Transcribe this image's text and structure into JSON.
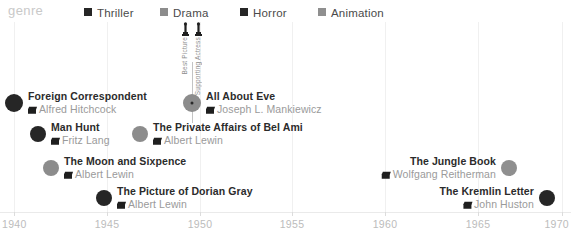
{
  "legend": {
    "title": "genre",
    "items": [
      {
        "label": "Thriller",
        "color": "#262626",
        "x": 84
      },
      {
        "label": "Drama",
        "color": "#8c8c8c",
        "x": 160
      },
      {
        "label": "Horror",
        "color": "#262626",
        "x": 240
      },
      {
        "label": "Animation",
        "color": "#8f8f8f",
        "x": 318
      }
    ]
  },
  "axis": {
    "label": "",
    "ticks": [
      {
        "value": 1940,
        "label": "1940",
        "x": 14
      },
      {
        "value": 1945,
        "label": "1945",
        "x": 107
      },
      {
        "value": 1950,
        "label": "1950",
        "x": 200
      },
      {
        "value": 1955,
        "label": "1955",
        "x": 292
      },
      {
        "value": 1960,
        "label": "1960",
        "x": 385
      },
      {
        "value": 1965,
        "label": "1965",
        "x": 478
      },
      {
        "value": 1970,
        "label": "1970",
        "x": 562
      }
    ]
  },
  "annotation": {
    "stem_x": 192,
    "stem_top": 40,
    "stem_bottom": 101,
    "awards": [
      {
        "icon": "award-statuette-icon",
        "text": "Best Picture"
      },
      {
        "icon": "award-statuette-icon",
        "text": "Supporting Actress"
      }
    ]
  },
  "chart_data": {
    "type": "scatter",
    "title": "",
    "subtitle": "",
    "xlabel": "",
    "ylabel": "",
    "xlim": [
      1940,
      1970
    ],
    "grid": true,
    "legend_position": "top",
    "categories": [
      "Thriller",
      "Drama",
      "Horror",
      "Animation"
    ],
    "points": [
      {
        "title": "Foreign Correspondent",
        "director": "Alfred Hitchcock",
        "year": 1940,
        "genre": "Thriller",
        "color": "#262626",
        "x": 14,
        "y": 81,
        "r": 9,
        "side": "left",
        "selected": false
      },
      {
        "title": "Man Hunt",
        "director": "Fritz Lang",
        "year": 1941,
        "genre": "Thriller",
        "color": "#262626",
        "x": 38,
        "y": 112,
        "r": 8,
        "side": "left",
        "selected": false
      },
      {
        "title": "The Moon and Sixpence",
        "director": "Albert Lewin",
        "year": 1942,
        "genre": "Drama",
        "color": "#8c8c8c",
        "x": 51,
        "y": 146,
        "r": 8,
        "side": "left",
        "selected": false
      },
      {
        "title": "The Picture of Dorian Gray",
        "director": "Albert Lewin",
        "year": 1945,
        "genre": "Horror",
        "color": "#262626",
        "x": 104,
        "y": 176,
        "r": 8,
        "side": "left",
        "selected": false
      },
      {
        "title": "The Private Affairs of Bel Ami",
        "director": "Albert Lewin",
        "year": 1947,
        "genre": "Drama",
        "color": "#8c8c8c",
        "x": 140,
        "y": 112,
        "r": 8,
        "side": "left",
        "selected": false
      },
      {
        "title": "All About Eve",
        "director": "Joseph L. Mankiewicz",
        "year": 1950,
        "genre": "Drama",
        "color": "#8c8c8c",
        "x": 192,
        "y": 81,
        "r": 9,
        "side": "left",
        "selected": true
      },
      {
        "title": "The Jungle Book",
        "director": "Wolfgang Reitherman",
        "year": 1967,
        "genre": "Animation",
        "color": "#8f8f8f",
        "x": 509,
        "y": 146,
        "r": 8,
        "side": "right",
        "selected": false
      },
      {
        "title": "The Kremlin Letter",
        "director": "John Huston",
        "year": 1970,
        "genre": "Thriller",
        "color": "#262626",
        "x": 547,
        "y": 176,
        "r": 8,
        "side": "right",
        "selected": false
      }
    ]
  }
}
